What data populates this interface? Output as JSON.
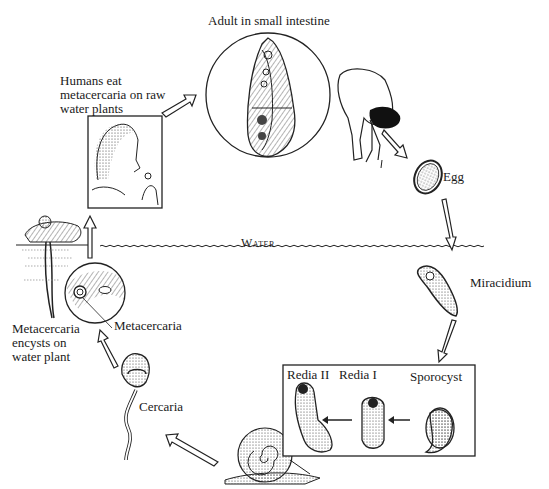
{
  "diagram": {
    "type": "life-cycle",
    "stages": [
      {
        "id": "adult",
        "label": "Adult in small intestine"
      },
      {
        "id": "egg",
        "label": "Egg"
      },
      {
        "id": "miracidium",
        "label": "Miracidium"
      },
      {
        "id": "sporocyst",
        "label": "Sporocyst"
      },
      {
        "id": "redia1",
        "label": "Redia I"
      },
      {
        "id": "redia2",
        "label": "Redia II"
      },
      {
        "id": "cercaria",
        "label": "Cercaria"
      },
      {
        "id": "metacercaria",
        "label": "Metacercaria"
      },
      {
        "id": "encyst",
        "label": "Metacercaria encysts on water plant"
      },
      {
        "id": "ingest",
        "label": "Humans eat metacercaria on raw water plants"
      }
    ],
    "water_label": "Water",
    "colors": {
      "ink": "#1a1a1a",
      "background": "#ffffff"
    }
  },
  "labels": {
    "adult": "Adult in small intestine",
    "humans_eat": "Humans eat metacercaria on raw water plants",
    "egg": "Egg",
    "water": "Water",
    "miracidium": "Miracidium",
    "metacercaria": "Metacercaria",
    "encysts": "Metacercaria encysts on water plant",
    "redia2": "Redia II",
    "redia1": "Redia I",
    "sporocyst": "Sporocyst",
    "cercaria": "Cercaria"
  }
}
